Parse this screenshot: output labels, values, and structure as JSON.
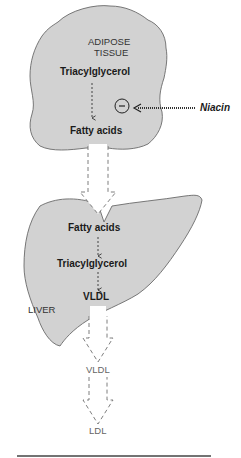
{
  "diagram": {
    "adipose": {
      "title_line1": "ADIPOSE",
      "title_line2": "TISSUE",
      "top_molecule": "Triacylglycerol",
      "bottom_molecule": "Fatty acids",
      "inhibition_symbol": "−"
    },
    "inhibitor": {
      "label": "Niacin"
    },
    "liver": {
      "title": "LIVER",
      "molecule_1": "Fatty acids",
      "molecule_2": "Triacylglycerol",
      "molecule_3": "VLDL"
    },
    "circulation": {
      "product_1": "VLDL",
      "product_2": "LDL"
    },
    "colors": {
      "organ_fill": "#d2d2d2",
      "organ_stroke": "#6a6a6a",
      "arrow_stroke": "#707070",
      "text": "#1a1a1a"
    }
  }
}
